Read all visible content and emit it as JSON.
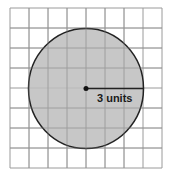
{
  "figure": {
    "type": "circle-on-grid",
    "grid": {
      "columns": 8,
      "rows": 8,
      "line_color": "#9a9a9a"
    },
    "circle": {
      "fill": "#bdbdbd",
      "stroke": "#222222",
      "radius_units": 3
    },
    "radius_label": "3 units"
  }
}
